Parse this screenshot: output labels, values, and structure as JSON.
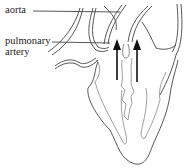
{
  "diagram": {
    "labels": [
      {
        "text": "aorta"
      },
      {
        "text": "pulmonary"
      },
      {
        "text": "artery"
      }
    ],
    "colors": {
      "line": "#444444",
      "arrow": "#111111",
      "text": "#222222"
    }
  }
}
